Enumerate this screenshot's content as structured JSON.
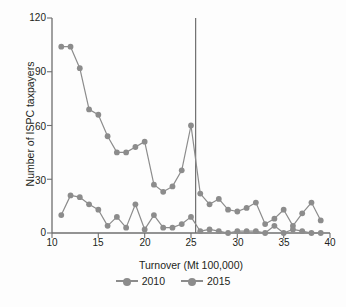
{
  "chart_data": {
    "type": "line",
    "title": "",
    "xlabel": "Turnover (Mt 100,000)",
    "ylabel": "Number of ISPC taxpayers",
    "xlim": [
      10,
      40
    ],
    "ylim": [
      0,
      120
    ],
    "xticks": [
      10,
      15,
      20,
      25,
      30,
      35,
      40
    ],
    "yticks": [
      0,
      30,
      60,
      90,
      120
    ],
    "grid": false,
    "legend_position": "bottom",
    "marker": "circle",
    "series_color": "#8c8c8c",
    "annotations": [
      {
        "type": "vline",
        "x": 25.5,
        "color": "#6f6f6f",
        "label": ""
      }
    ],
    "x": [
      11,
      12,
      13,
      14,
      15,
      16,
      17,
      18,
      19,
      20,
      21,
      22,
      23,
      24,
      25,
      26,
      27,
      28,
      29,
      30,
      31,
      32,
      33,
      34,
      35,
      36,
      37,
      38,
      39
    ],
    "series": [
      {
        "name": "2010",
        "values": [
          104,
          104,
          92,
          69,
          66,
          54,
          45,
          45,
          48,
          51,
          27,
          23,
          26,
          35,
          60,
          22,
          16,
          19,
          13,
          12,
          14,
          17,
          5,
          8,
          13,
          4,
          11,
          17,
          7
        ]
      },
      {
        "name": "2015",
        "values": [
          10,
          21,
          20,
          16,
          13,
          4,
          9,
          3,
          16,
          2,
          10,
          3,
          3,
          5,
          9,
          1,
          2,
          1,
          0,
          1,
          1,
          1,
          0,
          4,
          0,
          2,
          1,
          0,
          0
        ]
      }
    ]
  },
  "legend": {
    "items": [
      {
        "label": "2010"
      },
      {
        "label": "2015"
      }
    ]
  }
}
